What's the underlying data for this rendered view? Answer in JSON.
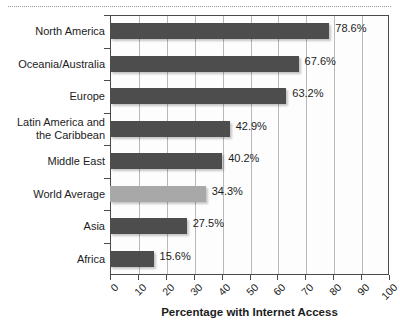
{
  "chart_data": {
    "type": "bar",
    "orientation": "horizontal",
    "title": "",
    "xlabel": "Percentage with Internet Access",
    "ylabel": "",
    "xlim": [
      0,
      100
    ],
    "xticks": [
      "0",
      "10",
      "20",
      "30",
      "40",
      "50",
      "60",
      "70",
      "80",
      "90",
      "100"
    ],
    "grid": true,
    "legend": "none",
    "categories": [
      "North America",
      "Oceania/Australia",
      "Europe",
      "Latin America and\nthe Caribbean",
      "Middle East",
      "World Average",
      "Asia",
      "Africa"
    ],
    "values": [
      78.6,
      67.6,
      63.2,
      42.9,
      40.2,
      34.3,
      27.5,
      15.6
    ],
    "value_labels": [
      "78.6%",
      "67.6%",
      "63.2%",
      "42.9%",
      "40.2%",
      "34.3%",
      "27.5%",
      "15.6%"
    ],
    "bar_colors": [
      "#4d4d4d",
      "#4d4d4d",
      "#4d4d4d",
      "#4d4d4d",
      "#4d4d4d",
      "#a8a8a8",
      "#4d4d4d",
      "#4d4d4d"
    ],
    "highlight_category": "World Average"
  },
  "colors": {
    "bar_dark": "#4d4d4d",
    "bar_light": "#a8a8a8",
    "axis": "#4a4a4a",
    "gridline": "#b9b9b9",
    "text": "#1c1c1c",
    "background": "#ffffff"
  },
  "labels": {
    "cat_0": "North America",
    "cat_1": "Oceania/Australia",
    "cat_2": "Europe",
    "cat_3_line1": "Latin America and",
    "cat_3_line2": "the Caribbean",
    "cat_4": "Middle East",
    "cat_5": "World Average",
    "cat_6": "Asia",
    "cat_7": "Africa",
    "val_0": "78.6%",
    "val_1": "67.6%",
    "val_2": "63.2%",
    "val_3": "42.9%",
    "val_4": "40.2%",
    "val_5": "34.3%",
    "val_6": "27.5%",
    "val_7": "15.6%",
    "tick_0": "0",
    "tick_1": "10",
    "tick_2": "20",
    "tick_3": "30",
    "tick_4": "40",
    "tick_5": "50",
    "tick_6": "60",
    "tick_7": "70",
    "tick_8": "80",
    "tick_9": "90",
    "tick_10": "100",
    "axis_title": "Percentage with Internet Access",
    "clipped_title": ""
  }
}
